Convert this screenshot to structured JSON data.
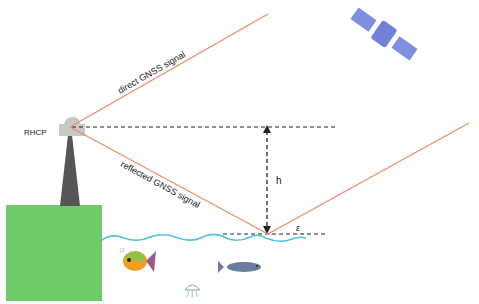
{
  "diagram": {
    "labels": {
      "antenna": "RHCP",
      "direct_signal": "direct GNSS signal",
      "reflected_signal": "reflected GNSS signal",
      "height": "h",
      "elevation_angle": "ε"
    },
    "colors": {
      "signal": "#f08a6a",
      "land": "#6fcb6a",
      "tower": "#555555",
      "water": "#4fc3e0",
      "satellite": "#7e8fe0",
      "dashed": "#222222"
    },
    "elements": [
      "satellite",
      "antenna",
      "tower",
      "land",
      "water surface",
      "fish",
      "jellyfish",
      "cod"
    ]
  }
}
